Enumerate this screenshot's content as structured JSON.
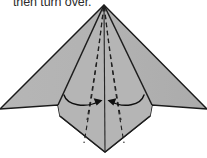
{
  "caption": {
    "text": "then turn over."
  },
  "figure": {
    "colors": {
      "paper_fill": "#b3b3b3",
      "paper_fill_shade": "#a9a9a9",
      "outline": "#1a1a1a",
      "fold_line": "#262626",
      "dashed_fold": "#1f1f1f",
      "arrow": "#111111",
      "background": "#ffffff"
    },
    "geometry": {
      "apex": [
        104,
        5
      ],
      "left_wing_tip": [
        0,
        109
      ],
      "right_wing_tip": [
        207,
        109
      ],
      "bottom_point": [
        105,
        152
      ],
      "left_shoulder": [
        58,
        105
      ],
      "right_shoulder": [
        152,
        105
      ],
      "left_notch": [
        60,
        116
      ],
      "right_notch": [
        150,
        116
      ]
    },
    "outline_path": "M104,5 L0,109 L58,105 L60,116 L105,152 L150,116 L152,105 L207,109 Z",
    "fold_lines": [
      {
        "name": "left-solid-fold",
        "path": "M104,5 L58,105"
      },
      {
        "name": "right-solid-fold",
        "path": "M104,5 L152,105"
      },
      {
        "name": "left-lower-edge",
        "path": "M60,116 L105,152"
      },
      {
        "name": "right-lower-edge",
        "path": "M150,116 L105,152"
      },
      {
        "name": "center-vertical-fold",
        "path": "M104,5 L105,152"
      }
    ],
    "dashed_folds": [
      {
        "name": "left-inner-dashed-fold",
        "path": "M104,6 C98,52 88,92 80,148"
      },
      {
        "name": "right-inner-dashed-fold",
        "path": "M104,6 C110,52 120,92 128,148"
      },
      {
        "name": "left-outer-dashed-fold",
        "path": "M104,6 C100,44 95,80 88,120"
      },
      {
        "name": "right-outer-dashed-fold",
        "path": "M104,6 C108,44 113,80 120,120"
      }
    ],
    "arrows": [
      {
        "name": "left-fold-arrow",
        "direction": "inward-right",
        "path": "M64,95 C68,106 88,108 101,101",
        "head": "101,101 95,99 97,106"
      },
      {
        "name": "right-fold-arrow",
        "direction": "inward-left",
        "path": "M144,95 C140,106 121,108 109,101",
        "head": "109,101 115,99 113,106"
      }
    ]
  }
}
